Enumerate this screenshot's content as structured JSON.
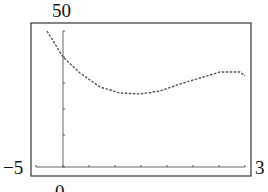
{
  "chart_data": {
    "type": "line",
    "title": "",
    "xlabel": "",
    "ylabel": "",
    "window_labels": {
      "ymax": "50",
      "xmin": "−5",
      "xmax": "3",
      "origin": "0"
    },
    "xlim": [
      -5,
      3
    ],
    "ylim": [
      -5,
      50
    ],
    "grid": false,
    "legend": null,
    "series": [
      {
        "name": "f(x)",
        "style": "dotted",
        "x": [
          -0.6,
          0.0,
          0.65,
          1.4,
          2.2,
          2.95,
          3.7,
          4.5,
          5.25,
          6.0,
          6.8,
          7.0
        ],
        "y": [
          47,
          38,
          32.5,
          27.5,
          25.5,
          25,
          26,
          28.5,
          30.5,
          33,
          33,
          31.5
        ]
      }
    ],
    "pixel_points": [
      [
        47,
        31
      ],
      [
        63,
        57
      ],
      [
        80,
        73
      ],
      [
        100,
        87
      ],
      [
        120,
        93
      ],
      [
        140,
        94
      ],
      [
        160,
        91
      ],
      [
        180,
        84
      ],
      [
        200,
        78
      ],
      [
        220,
        72
      ],
      [
        240,
        72
      ],
      [
        245,
        76
      ]
    ],
    "frame": {
      "x0": 31,
      "y0": 23,
      "x1": 251,
      "y1": 176
    },
    "axis_px": {
      "y_axis_x": 63,
      "x_axis_y": 167
    },
    "x_ticks_px": [
      36,
      63,
      89,
      115,
      141,
      167,
      193,
      219,
      245
    ],
    "y_ticks_px": [
      31,
      57,
      83,
      109,
      135,
      167
    ]
  }
}
